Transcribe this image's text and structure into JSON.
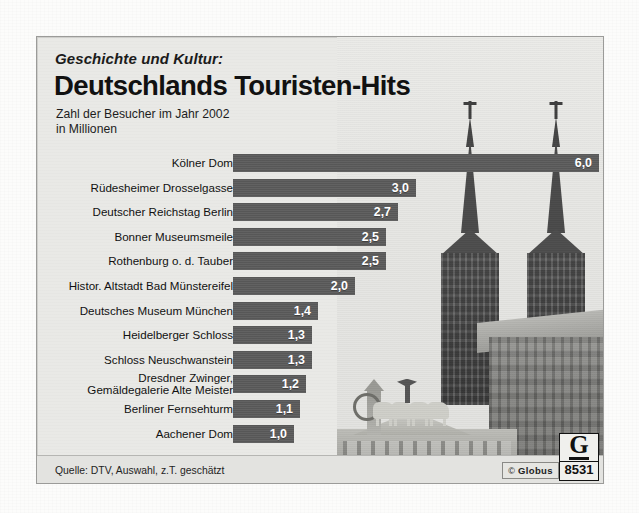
{
  "card": {
    "kicker": "Geschichte und Kultur:",
    "headline": "Deutschlands Touristen-Hits",
    "subtitle_line1": "Zahl der Besucher im Jahr 2002",
    "subtitle_line2": "in Millionen",
    "source": "Quelle: DTV, Auswahl, z.T. geschätzt"
  },
  "logo": {
    "copyright": "©",
    "brand": "Globus",
    "mark_letter": "G",
    "number": "8531"
  },
  "colors": {
    "bar": "#5b5b5b",
    "card_background": "#e9e9e6",
    "footer_background": "#e3e3e0",
    "text": "#111111",
    "value_text": "#ffffff"
  },
  "photos": [
    {
      "name": "cologne-cathedral-spires"
    },
    {
      "name": "brandenburg-gate-quadriga"
    }
  ],
  "chart_data": {
    "type": "bar",
    "orientation": "horizontal",
    "title": "Deutschlands Touristen-Hits",
    "subtitle": "Zahl der Besucher im Jahr 2002 in Millionen",
    "xlabel": "",
    "ylabel": "",
    "unit": "Millionen Besucher",
    "decimal_separator": ",",
    "grid": false,
    "legend": false,
    "xlim": [
      0,
      6.0
    ],
    "categories": [
      "Kölner Dom",
      "Rüdesheimer Drosselgasse",
      "Deutscher Reichstag Berlin",
      "Bonner Museumsmeile",
      "Rothenburg o. d. Tauber",
      "Histor. Altstadt Bad Münstereifel",
      "Deutsches Museum München",
      "Heidelberger Schloss",
      "Schloss Neuschwanstein",
      "Dresdner Zwinger, Gemäldegalerie Alte Meister",
      "Berliner Fernsehturm",
      "Aachener Dom"
    ],
    "values": [
      6.0,
      3.0,
      2.7,
      2.5,
      2.5,
      2.0,
      1.4,
      1.3,
      1.3,
      1.2,
      1.1,
      1.0
    ],
    "value_labels": [
      "6,0",
      "3,0",
      "2,7",
      "2,5",
      "2,5",
      "2,0",
      "1,4",
      "1,3",
      "1,3",
      "1,2",
      "1,1",
      "1,0"
    ],
    "rows": [
      {
        "label": "Kölner Dom",
        "label_line2": "",
        "value": 6.0,
        "value_label": "6,0"
      },
      {
        "label": "Rüdesheimer Drosselgasse",
        "label_line2": "",
        "value": 3.0,
        "value_label": "3,0"
      },
      {
        "label": "Deutscher Reichstag Berlin",
        "label_line2": "",
        "value": 2.7,
        "value_label": "2,7"
      },
      {
        "label": "Bonner Museumsmeile",
        "label_line2": "",
        "value": 2.5,
        "value_label": "2,5"
      },
      {
        "label": "Rothenburg o. d. Tauber",
        "label_line2": "",
        "value": 2.5,
        "value_label": "2,5"
      },
      {
        "label": "Histor. Altstadt Bad Münstereifel",
        "label_line2": "",
        "value": 2.0,
        "value_label": "2,0"
      },
      {
        "label": "Deutsches Museum München",
        "label_line2": "",
        "value": 1.4,
        "value_label": "1,4"
      },
      {
        "label": "Heidelberger Schloss",
        "label_line2": "",
        "value": 1.3,
        "value_label": "1,3"
      },
      {
        "label": "Schloss Neuschwanstein",
        "label_line2": "",
        "value": 1.3,
        "value_label": "1,3"
      },
      {
        "label": "Dresdner Zwinger,",
        "label_line2": "Gemäldegalerie Alte Meister",
        "value": 1.2,
        "value_label": "1,2"
      },
      {
        "label": "Berliner Fernsehturm",
        "label_line2": "",
        "value": 1.1,
        "value_label": "1,1"
      },
      {
        "label": "Aachener Dom",
        "label_line2": "",
        "value": 1.0,
        "value_label": "1,0"
      }
    ]
  }
}
